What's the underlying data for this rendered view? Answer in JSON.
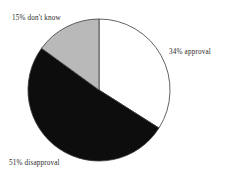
{
  "chart_data": {
    "type": "pie",
    "title": "",
    "subtitle": "",
    "xlabel": "",
    "ylabel": "",
    "grid": false,
    "legend_position": "none",
    "start_angle_deg": 0,
    "direction": "clockwise",
    "units": "percent",
    "total": 100,
    "categories": [
      "approval",
      "disapproval",
      "don't know"
    ],
    "values": [
      34,
      51,
      15
    ],
    "labels": [
      "34% approval",
      "51% disapproval",
      "15% don't know"
    ],
    "colors": [
      "#ffffff",
      "#0d0d0d",
      "#b9b9b9"
    ],
    "slices": [
      {
        "name": "approval",
        "value": 34,
        "label": "34% approval",
        "color": "#ffffff",
        "start_deg": 0,
        "end_deg": 122.4,
        "label_position": "right"
      },
      {
        "name": "disapproval",
        "value": 51,
        "label": "51% disapproval",
        "color": "#0d0d0d",
        "start_deg": 122.4,
        "end_deg": 306,
        "label_position": "bottom-left"
      },
      {
        "name": "don't know",
        "value": 15,
        "label": "15% don't know",
        "color": "#b9b9b9",
        "start_deg": 306,
        "end_deg": 360,
        "label_position": "top-left"
      }
    ],
    "geometry": {
      "center_x": 99,
      "center_y": 90,
      "radius": 71
    },
    "style": {
      "background": "#ffffff",
      "outline": "#3a3a3a",
      "text_color": "#2b2b2b"
    }
  }
}
